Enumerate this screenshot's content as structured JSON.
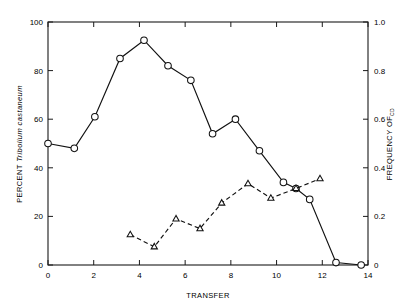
{
  "chart_data": {
    "type": "line",
    "title": "",
    "xlabel": "TRANSFER",
    "ylabel": "PERCENT Tribolium castaneum",
    "ylabel_parts": {
      "prefix": "PERCENT ",
      "italic": "Tribolium castaneum"
    },
    "y2label": "FREQUENCY OF",
    "y2label_subscript": "CD",
    "xlim": [
      0,
      14
    ],
    "ylim": [
      0,
      100
    ],
    "y2lim": [
      0,
      1.0
    ],
    "xticks": [
      0,
      2,
      4,
      6,
      8,
      10,
      12,
      14
    ],
    "xticklabels": [
      "0",
      "2",
      "4",
      "6",
      "8",
      "10",
      "12",
      "14"
    ],
    "yticks": [
      0,
      20,
      40,
      60,
      80,
      100
    ],
    "yticklabels": [
      "0",
      "20",
      "40",
      "60",
      "80",
      "100"
    ],
    "y2ticks": [
      0,
      0.2,
      0.4,
      0.6,
      0.8,
      1.0
    ],
    "y2ticklabels": [
      "0",
      "0.2",
      "0.4",
      "0.6",
      "0.8",
      "1.0"
    ],
    "grid": false,
    "legend": "none",
    "frame": "box",
    "tick_direction": "in",
    "series": [
      {
        "name": "PERCENT Tribolium castaneum",
        "axis": "left",
        "marker": "circle-open",
        "linestyle": "solid",
        "color": "#111111",
        "x": [
          0.0,
          1.15,
          2.05,
          3.15,
          4.2,
          5.25,
          6.25,
          7.2,
          8.2,
          9.25,
          10.3,
          10.85,
          11.45,
          12.6,
          13.7
        ],
        "y": [
          50,
          48,
          61,
          85,
          92.5,
          82,
          76,
          54,
          60,
          47,
          34,
          31.5,
          27,
          1,
          0
        ]
      },
      {
        "name": "FREQUENCY OF CD",
        "axis": "right",
        "marker": "triangle-open",
        "linestyle": "dashed",
        "color": "#111111",
        "x": [
          3.6,
          4.65,
          5.6,
          6.65,
          7.6,
          8.75,
          9.75,
          10.85,
          11.9
        ],
        "y": [
          0.125,
          0.075,
          0.19,
          0.15,
          0.255,
          0.335,
          0.275,
          0.315,
          0.355
        ]
      }
    ]
  },
  "axes": {
    "x_title": "TRANSFER",
    "y_left_prefix": "PERCENT ",
    "y_left_italic": "Tribolium castaneum",
    "y_right_main": "FREQUENCY OF",
    "y_right_sub": "CD"
  }
}
